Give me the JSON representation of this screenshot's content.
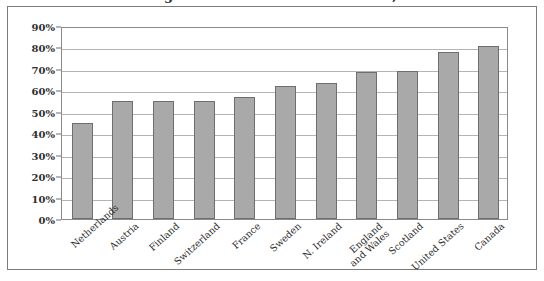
{
  "figure": {
    "title_cropped": "Percentage of households with a vehicle, 1990s",
    "frame_color": "#7c7c7c",
    "bar_fill_color": "#a9a9a9",
    "bar_border_color": "#6e6e6e",
    "gridline_color": "#b4b4b4"
  },
  "chart_data": {
    "type": "bar",
    "title": "Percentage of households with a vehicle, 1990s",
    "xlabel": "",
    "ylabel": "",
    "ylim": [
      0,
      90
    ],
    "ytick_step": 10,
    "ytick_labels": [
      "0%",
      "10%",
      "20%",
      "30%",
      "40%",
      "50%",
      "60%",
      "70%",
      "80%",
      "90%"
    ],
    "ytick_values": [
      0,
      10,
      20,
      30,
      40,
      50,
      60,
      70,
      80,
      90
    ],
    "grid": true,
    "legend": "none",
    "categories": [
      "Netherlands",
      "Austria",
      "Finland",
      "Switzerland",
      "France",
      "Sweden",
      "N. Ireland",
      "England and Wales",
      "Scotland",
      "United States",
      "Canada"
    ],
    "category_lines": [
      [
        "Netherlands"
      ],
      [
        "Austria"
      ],
      [
        "Finland"
      ],
      [
        "Switzerland"
      ],
      [
        "France"
      ],
      [
        "Sweden"
      ],
      [
        "N. Ireland"
      ],
      [
        "England",
        "and Wales"
      ],
      [
        "Scotland"
      ],
      [
        "United States"
      ],
      [
        "Canada"
      ]
    ],
    "values": [
      45,
      55,
      55,
      55,
      57,
      62,
      63.5,
      68.5,
      69,
      78,
      80.5
    ],
    "value_labels": [
      "45%",
      "55%",
      "55%",
      "55%",
      "57%",
      "62%",
      "64%",
      "69%",
      "69%",
      "78%",
      "81%"
    ]
  }
}
